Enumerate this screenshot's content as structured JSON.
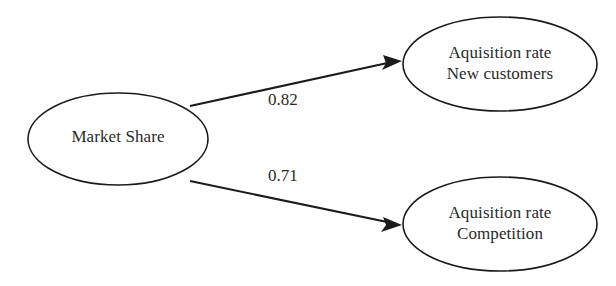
{
  "diagram": {
    "type": "path-diagram",
    "background_color": "#ffffff",
    "stroke_color": "#1b1b1b",
    "text_color": "#2a2a2a",
    "nodes": [
      {
        "id": "market-share",
        "shape": "ellipse",
        "lines": [
          "Market Share"
        ],
        "line1": "Market Share",
        "line2": "",
        "cx": 118,
        "cy": 139,
        "rx": 90,
        "ry": 46
      },
      {
        "id": "acquisition-new-customers",
        "shape": "ellipse",
        "lines": [
          "Aquisition rate",
          "New customers"
        ],
        "line1": "Aquisition rate",
        "line2": "New customers",
        "cx": 500,
        "cy": 64,
        "rx": 97,
        "ry": 47
      },
      {
        "id": "acquisition-competition",
        "shape": "ellipse",
        "lines": [
          "Aquisition rate",
          "Competition"
        ],
        "line1": "Aquisition rate",
        "line2": "Competition",
        "cx": 500,
        "cy": 224,
        "rx": 97,
        "ry": 47
      }
    ],
    "edges": [
      {
        "id": "edge-market-share-to-new-customers",
        "from": "market-share",
        "to": "acquisition-new-customers",
        "weight": "0.82",
        "arrowhead": true
      },
      {
        "id": "edge-market-share-to-competition",
        "from": "market-share",
        "to": "acquisition-competition",
        "weight": "0.71",
        "arrowhead": true
      }
    ]
  }
}
